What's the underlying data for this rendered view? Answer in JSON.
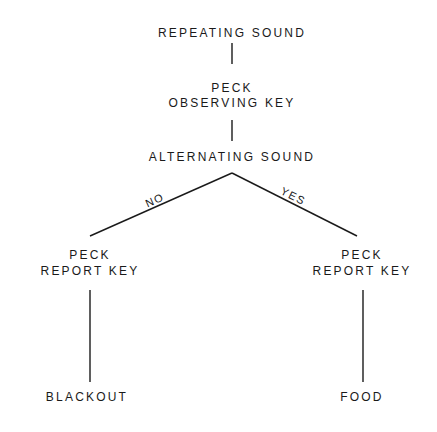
{
  "diagram": {
    "type": "flowchart-tree",
    "nodes": {
      "start": {
        "label": "REPEATING SOUND"
      },
      "observe_line1": {
        "label": "PECK"
      },
      "observe_line2": {
        "label": "OBSERVING KEY"
      },
      "alternating": {
        "label": "ALTERNATING SOUND"
      },
      "report_no_line1": {
        "label": "PECK"
      },
      "report_no_line2": {
        "label": "REPORT KEY"
      },
      "report_yes_line1": {
        "label": "PECK"
      },
      "report_yes_line2": {
        "label": "REPORT KEY"
      },
      "blackout": {
        "label": "BLACKOUT"
      },
      "food": {
        "label": "FOOD"
      }
    },
    "edges": {
      "no": {
        "label": "NO"
      },
      "yes": {
        "label": "YES"
      }
    }
  }
}
